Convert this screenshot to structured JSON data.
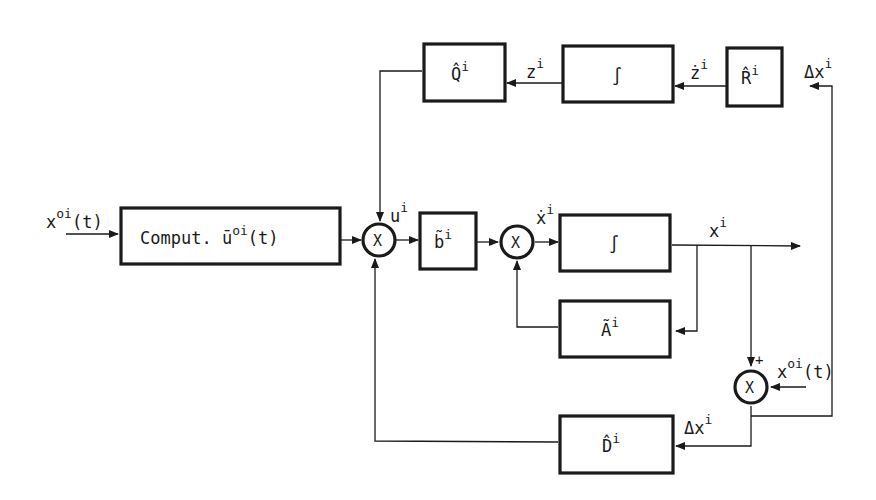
{
  "diagram": {
    "type": "block-diagram",
    "colors": {
      "line": "#1a1a1a",
      "background": "#ffffff"
    },
    "blocks": [
      {
        "id": "comput",
        "label": "Comput. ū",
        "sup": "oi",
        "suffix": "(t)"
      },
      {
        "id": "b",
        "label": "b̃",
        "sup": "i"
      },
      {
        "id": "int1",
        "label": "∫"
      },
      {
        "id": "A",
        "label": "Ã",
        "sup": "i"
      },
      {
        "id": "Q",
        "label": "Q̂",
        "sup": "i"
      },
      {
        "id": "int2",
        "label": "∫"
      },
      {
        "id": "R",
        "label": "R̂",
        "sup": "i"
      },
      {
        "id": "D",
        "label": "D̂",
        "sup": "i"
      }
    ],
    "junctions": [
      {
        "id": "j1",
        "label": "X"
      },
      {
        "id": "j2",
        "label": "X"
      },
      {
        "id": "j3",
        "label": "X",
        "sign": "+"
      }
    ],
    "signals": {
      "input": {
        "base": "x",
        "sup": "oi",
        "suffix": "(t)"
      },
      "u": {
        "base": "u",
        "sup": "i"
      },
      "xdot": {
        "base": "ẋ",
        "sup": "i"
      },
      "x": {
        "base": "x",
        "sup": "i"
      },
      "z": {
        "base": "z",
        "sup": "i"
      },
      "zdot": {
        "base": "ż",
        "sup": "i"
      },
      "dx_top": {
        "base": "Δx",
        "sup": "i"
      },
      "dx_bottom": {
        "base": "Δx",
        "sup": "i"
      },
      "ref": {
        "base": "x",
        "sup": "oi",
        "suffix": "(t)"
      }
    }
  }
}
